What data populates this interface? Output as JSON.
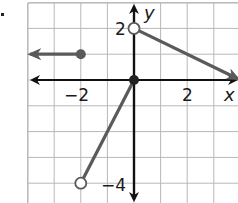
{
  "chart_data": {
    "type": "line",
    "title": "",
    "xlabel": "x",
    "ylabel": "y",
    "xlim": [
      -4.1,
      3.9
    ],
    "ylim": [
      -4.9,
      3.0
    ],
    "grid": true,
    "grid_step": 1,
    "tick_labels": {
      "x": [
        {
          "value": -2,
          "label": "−2"
        },
        {
          "value": 2,
          "label": "2"
        }
      ],
      "y": [
        {
          "value": 2,
          "label": "2"
        },
        {
          "value": -4,
          "label": "−4"
        }
      ]
    },
    "series": [
      {
        "name": "piece-1-left-ray",
        "kind": "ray",
        "points": [
          [
            -2,
            1
          ],
          [
            -3.9,
            1
          ]
        ],
        "start_point": {
          "x": -2,
          "y": 1,
          "closed": true
        },
        "arrow_end": true,
        "equation": "y = 1, x <= -2"
      },
      {
        "name": "piece-2-segment",
        "kind": "segment",
        "points": [
          [
            -2,
            -4
          ],
          [
            0,
            0
          ]
        ],
        "start_point": {
          "x": -2,
          "y": -4,
          "closed": false
        },
        "end_point": {
          "x": 0,
          "y": 0,
          "closed": true
        },
        "equation": "y = 2x, -2 < x <= 0"
      },
      {
        "name": "piece-3-right-ray",
        "kind": "ray",
        "points": [
          [
            0,
            2
          ],
          [
            3.9,
            0.05
          ]
        ],
        "start_point": {
          "x": 0,
          "y": 2,
          "closed": false
        },
        "arrow_end": true,
        "equation": "y = -0.5x + 2, x > 0"
      }
    ],
    "colors": {
      "curve": "#5a5a5a",
      "axes": "#111111",
      "grid": "#b8b8b8"
    }
  },
  "labels": {
    "x_axis": "x",
    "y_axis": "y",
    "tick_x_neg2": "−2",
    "tick_x_2": "2",
    "tick_y_2": "2",
    "tick_y_neg4": "−4"
  }
}
